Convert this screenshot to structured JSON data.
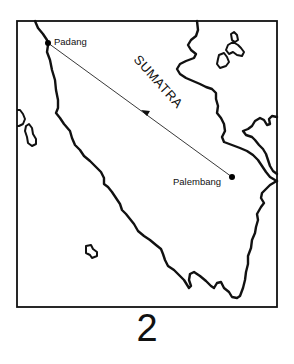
{
  "map": {
    "frame": {
      "x": 17,
      "y": 21,
      "width": 260,
      "height": 286
    },
    "region_label": "SUMATRA",
    "cities": [
      {
        "name": "Padang",
        "x": 48,
        "y": 43
      },
      {
        "name": "Palembang",
        "x": 232,
        "y": 177
      }
    ],
    "route": {
      "from": "Palembang",
      "to": "Padang",
      "arrow_direction": "toward Padang"
    },
    "colors": {
      "line": "#111111",
      "background": "#ffffff"
    }
  },
  "figure": {
    "number": "2"
  }
}
